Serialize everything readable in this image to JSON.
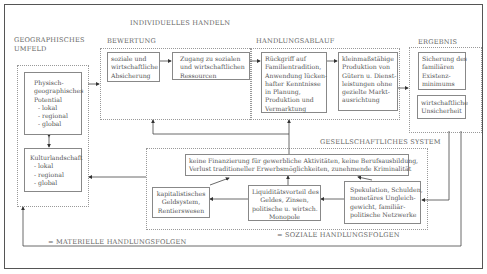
{
  "diagram": {
    "title": "INDIVIDUELLES HANDELN",
    "sections": {
      "geo": {
        "label_lines": [
          "GEOGRAPHISCHES",
          "UMFELD"
        ]
      },
      "bewertung": {
        "label": "BEWERTUNG"
      },
      "handlungsablauf": {
        "label": "HANDLUNGSABLAUF"
      },
      "ergebnis": {
        "label": "ERGEBNIS"
      },
      "gesellschaft": {
        "label": "GESELLSCHAFTLICHES SYSTEM"
      }
    },
    "boxes": {
      "physisch": [
        "Physisch-",
        "geographisches",
        "Potential",
        "  - lokal",
        "  - regional",
        "  - global"
      ],
      "kultur": [
        "Kulturlandschaft",
        "  - lokal",
        "  - regional",
        "  - global"
      ],
      "soziale": [
        "soziale und",
        "wirtschaftliche",
        "Absicherung"
      ],
      "zugang": [
        "Zugang zu sozialen",
        "und wirtschaftlichen",
        "Ressourcen"
      ],
      "rueckgriff": [
        "Rückgriff auf",
        "Familientradition,",
        "Anwendung lücken-",
        "hafter Kenntnisse",
        "in Planung,",
        "Produktion und",
        "Vermarktung"
      ],
      "kleinmass": [
        "kleinmaßstäbige",
        "Produktion von",
        "Gütern u. Dienst-",
        "leistungen ohne",
        "gezielte Markt-",
        "ausrichtung"
      ],
      "sicherung": [
        "Sicherung des",
        "familiären",
        "Existenz-",
        "minimums"
      ],
      "unsicherheit": [
        "wirtschaftliche",
        "Unsicherheit"
      ],
      "keine": [
        "keine Finanzierung für gewerbliche Aktivitäten, keine Berufsausbildung,",
        "Verlust traditioneller Erwerbsmöglichkeiten, zunehmende Kriminalität"
      ],
      "kapital": [
        "kapitalistisches",
        "Geldsystem,",
        "Rentierswesen"
      ],
      "liquiditaet": [
        "Liquiditätsvorteil des",
        "Geldes, Zinsen,",
        "politische u. wirtsch.",
        "Monopole"
      ],
      "spekulation": [
        "Spekulation, Schulden,",
        "monetäres Ungleich-",
        "gewicht, familiär-",
        "politische Netzwerke"
      ]
    },
    "footers": {
      "soziale_folgen": "= SOZIALE HANDLUNGSFOLGEN",
      "materielle_folgen": "= MATERIELLE HANDLUNGSFOLGEN"
    },
    "colors": {
      "line": "#444444",
      "box_border": "#888888",
      "dashed": "#999999",
      "text": "#555555"
    }
  }
}
